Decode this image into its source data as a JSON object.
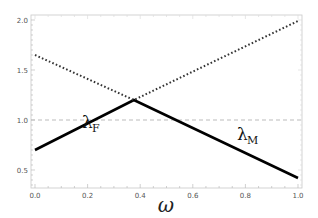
{
  "chart_data": {
    "type": "line",
    "title": "",
    "xlabel": "ω",
    "ylabel": "",
    "xlim": [
      0.0,
      1.0
    ],
    "ylim": [
      0.32,
      2.05
    ],
    "xticks": [
      "0.0",
      "0.2",
      "0.4",
      "0.6",
      "0.8",
      "1.0"
    ],
    "yticks": [
      "0.5",
      "1.0",
      "1.5",
      "2.0"
    ],
    "grid": false,
    "legend": "none",
    "series": [
      {
        "name": "solid",
        "style": "solid",
        "color": "#000000",
        "x": [
          0.0,
          0.376,
          1.0
        ],
        "y": [
          0.7,
          1.2,
          0.42
        ]
      },
      {
        "name": "dotted",
        "style": "dotted",
        "color": "#333333",
        "x": [
          0.0,
          0.376,
          1.0
        ],
        "y": [
          1.65,
          1.2,
          1.99
        ]
      },
      {
        "name": "reference",
        "style": "dashed",
        "color": "#aaaaaa",
        "x": [
          0.0,
          1.0
        ],
        "y": [
          1.0,
          1.0
        ]
      }
    ],
    "annotations": [
      {
        "text": "λ",
        "subscript": "F",
        "x": 0.19,
        "y": 0.93
      },
      {
        "text": "λ",
        "subscript": "M",
        "x": 0.77,
        "y": 0.8
      }
    ]
  }
}
